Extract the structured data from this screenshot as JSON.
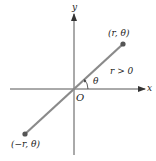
{
  "diagram": {
    "axes": {
      "x_label": "x",
      "y_label": "y",
      "origin_label": "O"
    },
    "points": [
      {
        "label": "(r, θ)",
        "x": 123,
        "y": 44
      },
      {
        "label": "(−r, θ)",
        "x": 25,
        "y": 134
      }
    ],
    "annotations": {
      "angle_label": "θ",
      "condition_label": "r > 0"
    },
    "colors": {
      "axis": "#555555",
      "line": "#8a8a8a",
      "point": "#555555",
      "text": "#222222"
    }
  }
}
